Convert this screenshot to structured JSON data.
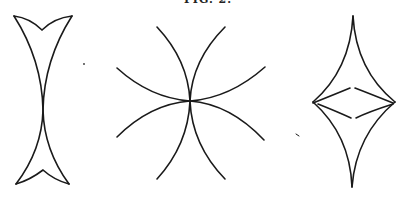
{
  "caption": "FIG. 2.",
  "figures": [
    {
      "id": "left",
      "description": "Vertical dart-shaped cusp curve with notched ends, self-crossing at center"
    },
    {
      "id": "middle",
      "description": "Four tangent arcs crossing at a single central point"
    },
    {
      "id": "right",
      "description": "Four-cusped astroid-like diamond with inner lens-shaped curves"
    }
  ],
  "colors": {
    "stroke": "#1a1a1a",
    "background": "#ffffff"
  }
}
